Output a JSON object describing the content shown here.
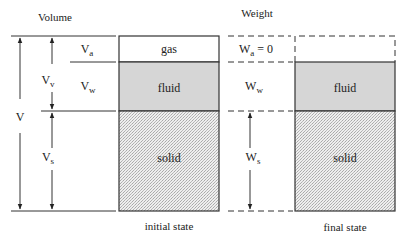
{
  "headers": {
    "volume": "Volume",
    "weight": "Weight"
  },
  "volume_labels": {
    "V": "V",
    "Vv_main": "V",
    "Vv_sub": "v",
    "Va_main": "V",
    "Va_sub": "a",
    "Vw_main": "V",
    "Vw_sub": "w",
    "Vs_main": "V",
    "Vs_sub": "s"
  },
  "weight_labels": {
    "Wa_main": "W",
    "Wa_sub": "a",
    "Wa_eq": " = 0",
    "Ww_main": "W",
    "Ww_sub": "w",
    "Ws_main": "W",
    "Ws_sub": "s"
  },
  "initial_state": {
    "caption": "initial state",
    "phases": [
      "gas",
      "fluid",
      "solid"
    ]
  },
  "final_state": {
    "caption": "final state",
    "phases": [
      "fluid",
      "solid"
    ]
  },
  "colors": {
    "fluid_fill": "#d6d6d6",
    "solid_fill": "#e4e4e4",
    "line": "#333333"
  }
}
